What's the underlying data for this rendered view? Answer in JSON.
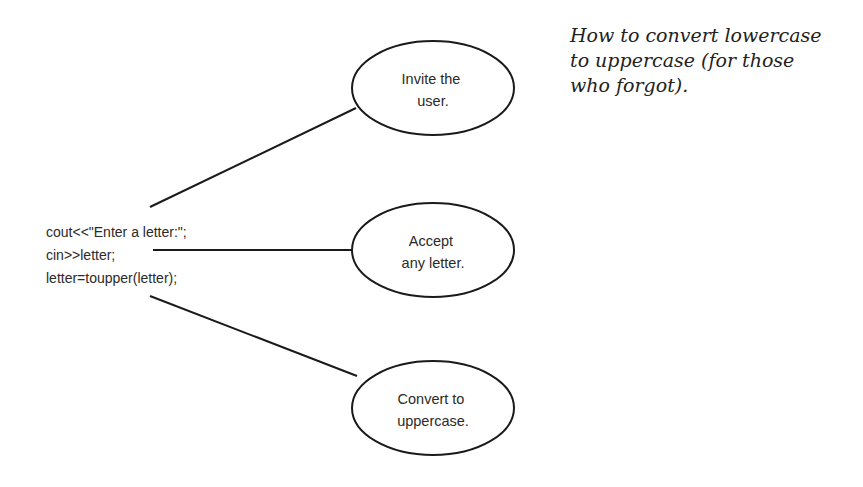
{
  "caption": {
    "lines": [
      "How to convert lowercase",
      "to uppercase (for those",
      "who forgot)."
    ]
  },
  "code": {
    "lines": [
      "cout<<\"Enter a letter:\";",
      "cin>>letter;",
      "letter=toupper(letter);"
    ]
  },
  "bubbles": [
    {
      "lines": [
        "Invite the",
        "user."
      ]
    },
    {
      "lines": [
        "Accept",
        "any letter."
      ]
    },
    {
      "lines": [
        "Convert to",
        "uppercase."
      ]
    }
  ],
  "colors": {
    "stroke": "#1a1a1a",
    "background": "#ffffff"
  }
}
